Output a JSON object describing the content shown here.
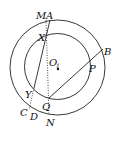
{
  "diagram": {
    "type": "concentric-circles-geometry",
    "center": {
      "label": "O"
    },
    "circles": [
      {
        "name": "outer-circle",
        "cx": 57.5,
        "cy": 67.5,
        "r": 47.5
      },
      {
        "name": "inner-circle",
        "cx": 57.5,
        "cy": 66.5,
        "r": 33
      }
    ],
    "points": {
      "M": {
        "label": "M",
        "x": 46,
        "y": 20,
        "lx": 37,
        "ly": 20
      },
      "A": {
        "label": "A",
        "x": 50,
        "y": 20,
        "lx": 47,
        "ly": 20
      },
      "X": {
        "label": "X",
        "x": 46,
        "y": 37,
        "lx": 38,
        "ly": 40
      },
      "O": {
        "label": "O",
        "x": 58,
        "y": 69,
        "lx": 49,
        "ly": 66,
        "sub": "1"
      },
      "B": {
        "label": "B",
        "x": 102,
        "y": 50,
        "lx": 104,
        "ly": 55
      },
      "P": {
        "label": "P",
        "x": 89,
        "y": 61,
        "lx": 90,
        "ly": 72
      },
      "Y": {
        "label": "Y",
        "x": 34,
        "y": 88,
        "lx": 25,
        "ly": 98
      },
      "Q": {
        "label": "Q",
        "x": 49,
        "y": 98,
        "lx": 42,
        "ly": 110
      },
      "C": {
        "label": "C",
        "x": 28,
        "y": 108,
        "lx": 20,
        "ly": 118
      },
      "D": {
        "label": "D",
        "x": 33,
        "y": 112,
        "lx": 30,
        "ly": 121
      },
      "N": {
        "label": "N",
        "x": 49,
        "y": 115,
        "lx": 47,
        "ly": 125
      }
    },
    "segments": [
      {
        "name": "line-AY",
        "from": "A",
        "to": "Y",
        "style": "solid"
      },
      {
        "name": "line-YD",
        "from": "Y",
        "to": "D",
        "style": "dotted"
      },
      {
        "name": "line-XQ",
        "from": "X",
        "to": "Q",
        "style": "dotted"
      },
      {
        "name": "line-MX",
        "from": "M",
        "to": "X",
        "style": "dotted"
      },
      {
        "name": "line-QN",
        "from": "Q",
        "to": "N",
        "style": "dotted"
      },
      {
        "name": "line-QB",
        "from": "Q",
        "to": "B",
        "style": "solid"
      }
    ]
  }
}
